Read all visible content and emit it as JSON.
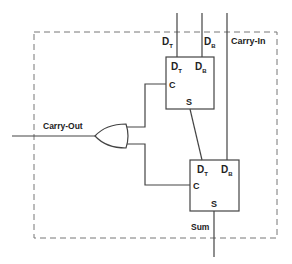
{
  "diagram": {
    "inputs": {
      "dt_label": "D",
      "dt_sub": "T",
      "db_label": "D",
      "db_sub": "B",
      "carry_in": "Carry-In"
    },
    "top_box": {
      "dt_label": "D",
      "dt_sub": "T",
      "db_label": "D",
      "db_sub": "B",
      "c_label": "C",
      "s_label": "S"
    },
    "bottom_box": {
      "dt_label": "D",
      "dt_sub": "T",
      "db_label": "D",
      "db_sub": "B",
      "c_label": "C",
      "s_label": "S"
    },
    "outputs": {
      "carry_out": "Carry-Out",
      "sum": "Sum"
    },
    "colors": {
      "line": "#444444",
      "dashed": "#777777"
    }
  }
}
